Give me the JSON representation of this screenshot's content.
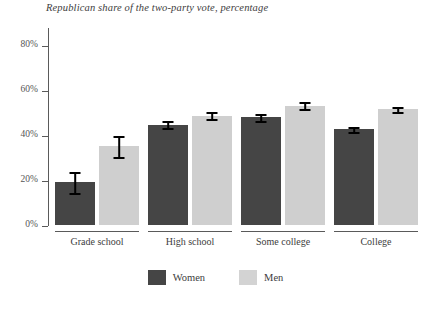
{
  "chart_data": {
    "type": "bar",
    "title": "Republican share of the two-party vote, percentage",
    "xlabel": "",
    "ylabel": "",
    "ylim": [
      0,
      88
    ],
    "grid": false,
    "legend_position": "bottom-center",
    "categories": [
      "Grade school",
      "High school",
      "Some college",
      "College"
    ],
    "ytick_labels": [
      "0%",
      "20%",
      "40%",
      "60%",
      "80%"
    ],
    "ytick_values": [
      0,
      20,
      40,
      60,
      80
    ],
    "series": [
      {
        "name": "Women",
        "color": "#454545",
        "values": [
          19,
          44.5,
          48,
          42.5
        ],
        "error_low": [
          14,
          42.5,
          46,
          41
        ],
        "error_high": [
          24,
          46.5,
          50,
          44
        ]
      },
      {
        "name": "Men",
        "color": "#cfcfcf",
        "values": [
          35,
          48.5,
          53,
          51.5
        ],
        "error_low": [
          30,
          46.5,
          51,
          50
        ],
        "error_high": [
          40,
          50.5,
          55,
          53
        ]
      }
    ]
  },
  "legend": {
    "items": [
      {
        "label": "Women",
        "swatch": "women"
      },
      {
        "label": "Men",
        "swatch": "men"
      }
    ]
  }
}
